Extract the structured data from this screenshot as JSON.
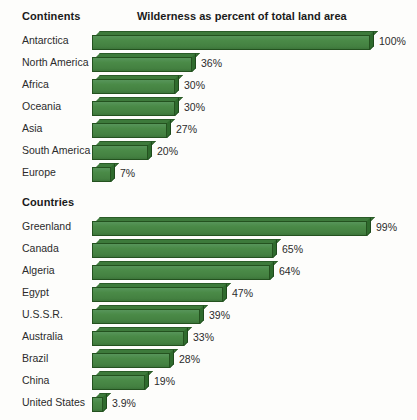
{
  "chart_data": {
    "type": "bar",
    "title": "Wilderness as percent of total land area",
    "xlabel": "",
    "ylabel": "",
    "xlim": [
      0,
      100
    ],
    "grid": false,
    "legend": "none",
    "orientation": "horizontal",
    "groups": [
      {
        "heading": "Continents",
        "categories": [
          "Antarctica",
          "North America",
          "Africa",
          "Oceania",
          "Asia",
          "South America",
          "Europe"
        ],
        "values": [
          100,
          36,
          30,
          30,
          27,
          20,
          7
        ],
        "labels": [
          "100%",
          "36%",
          "30%",
          "30%",
          "27%",
          "20%",
          "7%"
        ]
      },
      {
        "heading": "Countries",
        "categories": [
          "Greenland",
          "Canada",
          "Algeria",
          "Egypt",
          "U.S.S.R.",
          "Australia",
          "Brazil",
          "China",
          "United States"
        ],
        "values": [
          99,
          65,
          64,
          47,
          39,
          33,
          28,
          19,
          3.9
        ],
        "labels": [
          "99%",
          "65%",
          "64%",
          "47%",
          "39%",
          "33%",
          "28%",
          "19%",
          "3.9%"
        ]
      }
    ],
    "colors": {
      "bar_face": "#4a8a47",
      "bar_top": "#3d7a3b",
      "bar_side": "#2f6b2d",
      "bar_outline": "#24521f",
      "text": "#2b2b2b",
      "background": "#fdfdfb"
    }
  }
}
